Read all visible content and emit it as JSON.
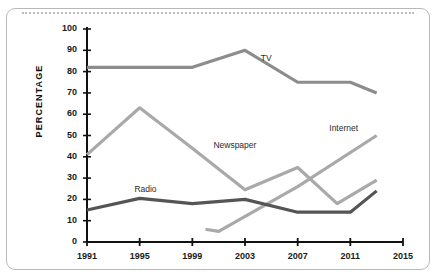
{
  "chart_data": {
    "type": "line",
    "title": "",
    "xlabel": "",
    "ylabel": "PERCENTAGE",
    "xlim": [
      1991,
      2015
    ],
    "ylim": [
      0,
      100
    ],
    "grid": false,
    "legend_position": "inline-labels",
    "xticks": [
      "1991",
      "1995",
      "1999",
      "2003",
      "2007",
      "2011",
      "2015"
    ],
    "yticks": [
      "0",
      "10",
      "20",
      "30",
      "40",
      "50",
      "60",
      "70",
      "80",
      "90",
      "100"
    ],
    "series": [
      {
        "name": "TV",
        "color": "#8c8c8c",
        "x": [
          1991,
          1995,
          1999,
          2003,
          2007,
          2011,
          2013
        ],
        "values": [
          82,
          82,
          82,
          90,
          75,
          75,
          70
        ],
        "label_x": 2004.2,
        "label_y": 86
      },
      {
        "name": "Newspaper",
        "color": "#a9a9a9",
        "x": [
          1991,
          1995,
          1999,
          2003,
          2007,
          2010,
          2013
        ],
        "values": [
          41,
          63,
          44,
          24.5,
          35,
          18,
          29
        ],
        "label_x": 2000.6,
        "label_y": 45
      },
      {
        "name": "Internet",
        "color": "#a9a9a9",
        "x": [
          2000,
          2001,
          2007,
          2013
        ],
        "values": [
          6,
          5,
          26,
          50
        ],
        "label_x": 2009.4,
        "label_y": 53
      },
      {
        "name": "Radio",
        "color": "#555555",
        "x": [
          1991,
          1995,
          1999,
          2003,
          2007,
          2011,
          2013
        ],
        "values": [
          15,
          20.5,
          18,
          20,
          14,
          14,
          24
        ],
        "label_x": 1994.6,
        "label_y": 24.5
      }
    ]
  },
  "axis": {
    "y_title": "PERCENTAGE"
  }
}
